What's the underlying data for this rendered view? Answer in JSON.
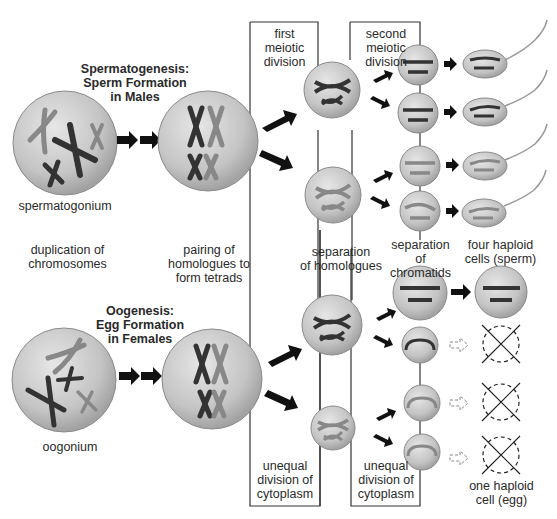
{
  "spermatogenesis": {
    "title": "Spermatogenesis:\nSperm Formation\nin Males",
    "start_cell": "spermatogonium",
    "final_label": "four haploid\ncells (sperm)"
  },
  "oogenesis": {
    "title": "Oogenesis:\nEgg Formation\nin Females",
    "start_cell": "oogonium",
    "final_label": "one haploid\ncell (egg)"
  },
  "stages": {
    "duplication": "duplication of\nchromosomes",
    "pairing": "pairing of\nhomologues to\nform tetrads",
    "first_division": "first\nmeiotic\ndivision",
    "second_division": "second\nmeiotic\ndivision",
    "separation_homologues": "separation\nof homologues",
    "separation_chromatids": "separation\nof chromatids",
    "unequal_1": "unequal\ndivision of\ncytoplasm",
    "unequal_2": "unequal\ndivision of\ncytoplasm"
  },
  "colors": {
    "cell_fill": "#c8c8c8",
    "cell_edge": "#8a8a8a",
    "chromosome_dark": "#3a3a3a",
    "chromosome_light": "#8c8c8c",
    "arrow": "#111111",
    "box_line": "#333333"
  }
}
